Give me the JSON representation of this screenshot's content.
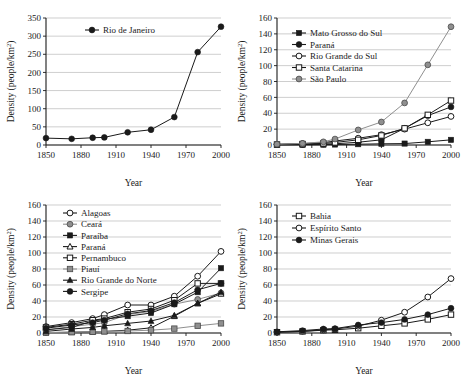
{
  "figure": {
    "panel_count": 4,
    "background": "#ffffff"
  },
  "axis": {
    "xlabel": "Year",
    "ylabel": "Density (people/km",
    "ylabel_sup": "2",
    "ylabel_close": ")"
  },
  "chart_data": [
    {
      "id": "panel-top-left",
      "type": "line",
      "title": "",
      "xlabel": "Year",
      "ylabel": "Density (people/km2)",
      "xlim": [
        1850,
        2000
      ],
      "ylim": [
        0,
        350
      ],
      "xticks": [
        1850,
        1880,
        1910,
        1940,
        1970,
        2000
      ],
      "yticks": [
        0,
        50,
        100,
        150,
        200,
        250,
        300,
        350
      ],
      "grid": true,
      "legend_position": "top-center",
      "x": [
        1850,
        1872,
        1890,
        1900,
        1920,
        1940,
        1960,
        1980,
        2000
      ],
      "series": [
        {
          "name": "Rio de Janeiro",
          "marker": "filled-circle",
          "color": "#1a1a1a",
          "values": [
            19,
            17,
            20,
            21,
            35,
            42,
            77,
            256,
            326
          ]
        }
      ]
    },
    {
      "id": "panel-top-right",
      "type": "line",
      "title": "",
      "xlabel": "Year",
      "ylabel": "Density (people/km2)",
      "xlim": [
        1850,
        2000
      ],
      "ylim": [
        0,
        160
      ],
      "xticks": [
        1850,
        1880,
        1910,
        1940,
        1970,
        2000
      ],
      "yticks": [
        0,
        20,
        40,
        60,
        80,
        100,
        120,
        140,
        160
      ],
      "grid": true,
      "legend_position": "top-left",
      "x": [
        1850,
        1872,
        1890,
        1900,
        1920,
        1940,
        1960,
        1980,
        2000
      ],
      "series": [
        {
          "name": "Mato Grosso do Sul",
          "marker": "filled-square",
          "color": "#1a1a1a",
          "values": [
            0.2,
            0.3,
            0.4,
            0.6,
            1.0,
            1.5,
            1.8,
            4.0,
            6.5
          ]
        },
        {
          "name": "Paraná",
          "marker": "filled-circle",
          "color": "#1a1a1a",
          "values": [
            0.3,
            0.6,
            1.0,
            1.5,
            3.5,
            6.5,
            21,
            37,
            48
          ]
        },
        {
          "name": "Rio Grande do Sul",
          "marker": "open-circle",
          "color": "#1a1a1a",
          "values": [
            1.0,
            1.8,
            3.0,
            5.0,
            8.5,
            13,
            20,
            28,
            36
          ]
        },
        {
          "name": "Santa Catarina",
          "marker": "open-square",
          "color": "#1a1a1a",
          "values": [
            0.6,
            1.2,
            2.0,
            3.2,
            6.5,
            12,
            21,
            38,
            56
          ]
        },
        {
          "name": "São Paulo",
          "marker": "gray-circle",
          "color": "#8a8a8a",
          "values": [
            1.0,
            2.0,
            4.0,
            7.5,
            19,
            29,
            53,
            101,
            149
          ]
        }
      ]
    },
    {
      "id": "panel-bottom-left",
      "type": "line",
      "title": "",
      "xlabel": "Year",
      "ylabel": "Density (people/km2)",
      "xlim": [
        1850,
        2000
      ],
      "ylim": [
        0,
        160
      ],
      "xticks": [
        1850,
        1880,
        1910,
        1940,
        1970,
        2000
      ],
      "yticks": [
        0,
        20,
        40,
        60,
        80,
        100,
        120,
        140,
        160
      ],
      "grid": true,
      "legend_position": "top-left",
      "x": [
        1850,
        1872,
        1890,
        1900,
        1920,
        1940,
        1960,
        1980,
        2000
      ],
      "series": [
        {
          "name": "Alagoas",
          "marker": "open-circle",
          "color": "#1a1a1a",
          "values": [
            8,
            13,
            18,
            23,
            35,
            35,
            46,
            71,
            102
          ]
        },
        {
          "name": "Ceará",
          "marker": "gray-circle",
          "color": "#8a8a8a",
          "values": [
            4,
            8,
            11,
            13,
            23,
            27,
            36,
            42,
            50
          ]
        },
        {
          "name": "Paraíba",
          "marker": "filled-square",
          "color": "#1a1a1a",
          "values": [
            4,
            7,
            15,
            17,
            21,
            25,
            36,
            51,
            81
          ]
        },
        {
          "name": "Paraná",
          "marker": "open-triangle",
          "color": "#1a1a1a",
          "values": [
            0.5,
            1.0,
            1.5,
            2.0,
            3.5,
            6.5,
            21,
            37,
            49
          ]
        },
        {
          "name": "Pernambuco",
          "marker": "open-square",
          "color": "#1a1a1a",
          "values": [
            7,
            11,
            16,
            18,
            26,
            30,
            41,
            62,
            62
          ]
        },
        {
          "name": "Piauí",
          "marker": "gray-square",
          "color": "#8a8a8a",
          "values": [
            0.5,
            1.0,
            1.5,
            2.0,
            2.5,
            3.5,
            5.5,
            9.0,
            12
          ]
        },
        {
          "name": "Rio Grande do Norte",
          "marker": "filled-triangle",
          "color": "#1a1a1a",
          "values": [
            2,
            5,
            7,
            9,
            12,
            15,
            22,
            37,
            51
          ]
        },
        {
          "name": "Sergipe",
          "marker": "filled-circle",
          "color": "#1a1a1a",
          "values": [
            6,
            10,
            13,
            16,
            24,
            28,
            38,
            54,
            62
          ]
        }
      ]
    },
    {
      "id": "panel-bottom-right",
      "type": "line",
      "title": "",
      "xlabel": "Year",
      "ylabel": "Density (people/km2)",
      "xlim": [
        1850,
        2000
      ],
      "ylim": [
        0,
        160
      ],
      "xticks": [
        1850,
        1880,
        1910,
        1940,
        1970,
        2000
      ],
      "yticks": [
        0,
        20,
        40,
        60,
        80,
        100,
        120,
        140,
        160
      ],
      "grid": true,
      "legend_position": "top-center",
      "x": [
        1850,
        1872,
        1890,
        1900,
        1920,
        1940,
        1960,
        1980,
        2000
      ],
      "series": [
        {
          "name": "Bahia",
          "marker": "open-square",
          "color": "#1a1a1a",
          "values": [
            1.0,
            2.0,
            3.5,
            4.0,
            6.0,
            9.0,
            12,
            17,
            23
          ]
        },
        {
          "name": "Espírito Santo",
          "marker": "open-circle",
          "color": "#1a1a1a",
          "values": [
            1.0,
            2.0,
            4.0,
            5.0,
            8.5,
            16,
            26,
            45,
            68
          ]
        },
        {
          "name": "Minas Gerais",
          "marker": "filled-circle",
          "color": "#1a1a1a",
          "values": [
            1.5,
            3.0,
            5.0,
            5.5,
            10,
            13,
            17,
            23,
            31
          ]
        }
      ]
    }
  ]
}
